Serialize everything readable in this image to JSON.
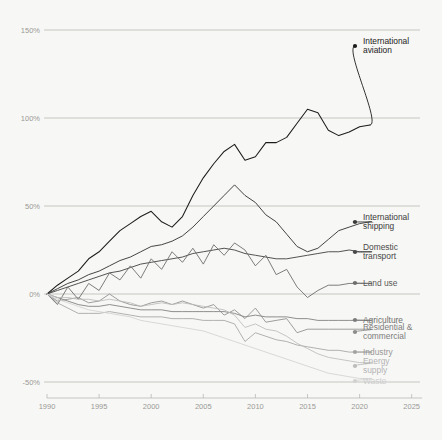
{
  "chart_data": {
    "type": "line",
    "title": "",
    "subtitle": "",
    "xlabel": "",
    "ylabel": "",
    "xlim": [
      1990,
      2026
    ],
    "ylim": [
      -55,
      158
    ],
    "grid": "horizontal",
    "legend_position": "right-inline-labels",
    "y_ticks": [
      "150%",
      "100%",
      "50%",
      "0%",
      "-50%"
    ],
    "y_tick_values": [
      150,
      100,
      50,
      0,
      -50
    ],
    "x_ticks": [
      "1990",
      "1995",
      "2000",
      "2005",
      "2010",
      "2015",
      "2020",
      "2025"
    ],
    "x_tick_values": [
      1990,
      1995,
      2000,
      2005,
      2010,
      2015,
      2020,
      2025
    ],
    "x": [
      1990,
      1991,
      1992,
      1993,
      1994,
      1995,
      1996,
      1997,
      1998,
      1999,
      2000,
      2001,
      2002,
      2003,
      2004,
      2005,
      2006,
      2007,
      2008,
      2009,
      2010,
      2011,
      2012,
      2013,
      2014,
      2015,
      2016,
      2017,
      2018,
      2019,
      2020,
      2021
    ],
    "series": [
      {
        "name": "International aviation",
        "color": "#1c1c1c",
        "width": 1.05,
        "label_y": 46,
        "values": [
          0,
          5,
          9,
          13,
          20,
          24,
          30,
          36,
          40,
          44,
          47,
          41,
          38,
          44,
          56,
          66,
          74,
          81,
          85,
          76,
          78,
          86,
          86,
          89,
          97,
          105,
          103,
          93,
          90,
          92,
          95,
          96
        ]
      },
      {
        "name": "International shipping",
        "color": "#3a3a3a",
        "width": 0.95,
        "label_y": 222,
        "values": [
          0,
          3,
          6,
          8,
          11,
          13,
          16,
          19,
          21,
          24,
          27,
          28,
          30,
          33,
          38,
          44,
          50,
          56,
          62,
          56,
          52,
          45,
          41,
          34,
          27,
          24,
          26,
          31,
          36,
          38,
          40,
          41
        ]
      },
      {
        "name": "Domestic transport",
        "color": "#4a4a4a",
        "width": 0.95,
        "label_y": 252,
        "values": [
          0,
          2,
          4,
          6,
          8,
          10,
          12,
          13,
          15,
          17,
          18,
          19,
          20,
          21,
          23,
          24,
          25,
          26,
          25,
          23,
          22,
          21,
          20,
          20,
          21,
          22,
          23,
          24,
          24,
          25,
          24,
          24
        ]
      },
      {
        "name": "Land use",
        "color": "#6e6e6e",
        "width": 0.9,
        "label_y": 283,
        "values": [
          0,
          -6,
          4,
          -3,
          6,
          2,
          12,
          8,
          16,
          9,
          20,
          14,
          24,
          18,
          26,
          17,
          28,
          22,
          29,
          25,
          16,
          22,
          11,
          14,
          4,
          -2,
          2,
          5,
          5,
          6,
          6,
          6
        ]
      },
      {
        "name": "Agriculture",
        "color": "#7c7c7c",
        "width": 0.85,
        "label_y": 320,
        "values": [
          0,
          -2,
          -4,
          -6,
          -7,
          -7,
          -6,
          -7,
          -8,
          -9,
          -9,
          -9,
          -10,
          -10,
          -10,
          -10,
          -10,
          -10,
          -11,
          -13,
          -12,
          -13,
          -13,
          -13,
          -14,
          -14,
          -15,
          -15,
          -15,
          -15,
          -15,
          -15
        ]
      },
      {
        "name": "Residential & commercial",
        "color": "#8c8c8c",
        "width": 0.85,
        "label_y": 332,
        "values": [
          0,
          -4,
          -3,
          -2,
          -5,
          -4,
          0,
          -4,
          -6,
          -7,
          -5,
          -4,
          -6,
          -4,
          -6,
          -8,
          -6,
          -12,
          -9,
          -14,
          -8,
          -16,
          -15,
          -14,
          -22,
          -20,
          -20,
          -20,
          -20,
          -20,
          -20,
          -20
        ]
      },
      {
        "name": "Industry",
        "color": "#a4a4a4",
        "width": 0.85,
        "label_y": 352,
        "values": [
          0,
          -5,
          -8,
          -11,
          -11,
          -11,
          -10,
          -11,
          -12,
          -13,
          -13,
          -13,
          -14,
          -14,
          -14,
          -15,
          -15,
          -15,
          -17,
          -27,
          -22,
          -24,
          -26,
          -27,
          -29,
          -30,
          -31,
          -32,
          -32,
          -33,
          -33,
          -33
        ]
      },
      {
        "name": "Energy supply",
        "color": "#bcbcbc",
        "width": 0.85,
        "label_y": 366,
        "values": [
          0,
          -2,
          -2,
          -3,
          -3,
          -4,
          -3,
          -4,
          -5,
          -7,
          -6,
          -5,
          -6,
          -5,
          -6,
          -7,
          -8,
          -9,
          -12,
          -19,
          -17,
          -20,
          -21,
          -24,
          -28,
          -31,
          -34,
          -36,
          -37,
          -38,
          -39,
          -39
        ]
      },
      {
        "name": "Waste",
        "color": "#d2d2d2",
        "width": 0.85,
        "label_y": 381,
        "values": [
          0,
          -3,
          -5,
          -7,
          -9,
          -10,
          -11,
          -12,
          -13,
          -15,
          -16,
          -17,
          -18,
          -19,
          -20,
          -21,
          -23,
          -25,
          -27,
          -29,
          -31,
          -33,
          -35,
          -37,
          -39,
          -41,
          -43,
          -45,
          -46,
          -47,
          -48,
          -48
        ]
      }
    ],
    "annotations": [
      {
        "text": "International aviation",
        "lines": [
          "International",
          "aviation"
        ],
        "color": "#222222"
      },
      {
        "text": "International shipping",
        "lines": [
          "International",
          "shipping"
        ],
        "color": "#3a3a3a"
      },
      {
        "text": "Domestic transport",
        "lines": [
          "Domestic",
          "transport"
        ],
        "color": "#4a4a4a"
      },
      {
        "text": "Land use",
        "lines": [
          "Land use"
        ],
        "color": "#5a5a5a"
      },
      {
        "text": "Agriculture",
        "lines": [
          "Agriculture"
        ],
        "color": "#6f6f6f"
      },
      {
        "text": "Residential & commercial",
        "lines": [
          "Residential &",
          "commercial"
        ],
        "color": "#7d7d7d"
      },
      {
        "text": "Industry",
        "lines": [
          "Industry"
        ],
        "color": "#999999"
      },
      {
        "text": "Energy supply",
        "lines": [
          "Energy",
          "supply"
        ],
        "color": "#b5b5b5"
      },
      {
        "text": "Waste",
        "lines": [
          "Waste"
        ],
        "color": "#cfcfcf"
      }
    ],
    "colors": {
      "background": "#f7f7f5",
      "gridline": "#b0b0ac",
      "tick_label": "#9a9a96",
      "darkest_series": "#1c1c1c",
      "lightest_series": "#d2d2d2"
    }
  }
}
